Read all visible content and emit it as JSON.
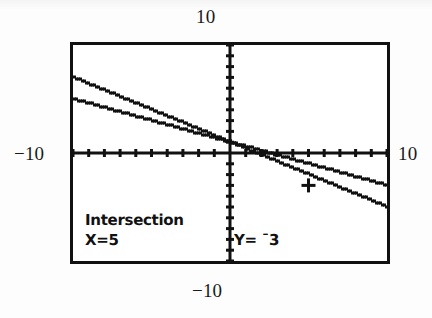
{
  "axis_annotations": {
    "top": "10",
    "left": "−10",
    "right": "10",
    "bottom": "−10"
  },
  "calculator_screen": {
    "readout": {
      "title": "Intersection",
      "x_value": "X=5",
      "y_value": "Y= ¯3"
    }
  },
  "chart_data": {
    "type": "line",
    "title": "",
    "subtitle": "",
    "xlabel": "",
    "ylabel": "",
    "xlim": [
      -10,
      10
    ],
    "ylim": [
      -10,
      10
    ],
    "grid": false,
    "legend": false,
    "axis_tick_spacing": 1,
    "x_axis_at_y": 0,
    "y_axis_at_x": 0,
    "axis_labels_shown": {
      "xmax": "10",
      "xmin": "−10",
      "ymax": "10",
      "ymin": "−10"
    },
    "series": [
      {
        "name": "Y1",
        "style": "dotted-pixel-line",
        "points": [
          [
            -10,
            7.0
          ],
          [
            -5,
            4.0
          ],
          [
            0,
            1.0
          ],
          [
            5,
            -2.0
          ],
          [
            10,
            -5.0
          ]
        ],
        "slope": -0.6,
        "intercept": 1.0
      },
      {
        "name": "Y2",
        "style": "dotted-pixel-line",
        "points": [
          [
            -10,
            5.0
          ],
          [
            -5,
            3.0
          ],
          [
            0,
            1.0
          ],
          [
            5,
            -1.0
          ],
          [
            10,
            -3.0
          ]
        ],
        "slope": -0.4,
        "intercept": 1.0
      }
    ],
    "annotations": [
      {
        "type": "intersection-cursor",
        "label": "Intersection",
        "x": 5,
        "y": -3,
        "marker": "crosshair"
      }
    ]
  }
}
